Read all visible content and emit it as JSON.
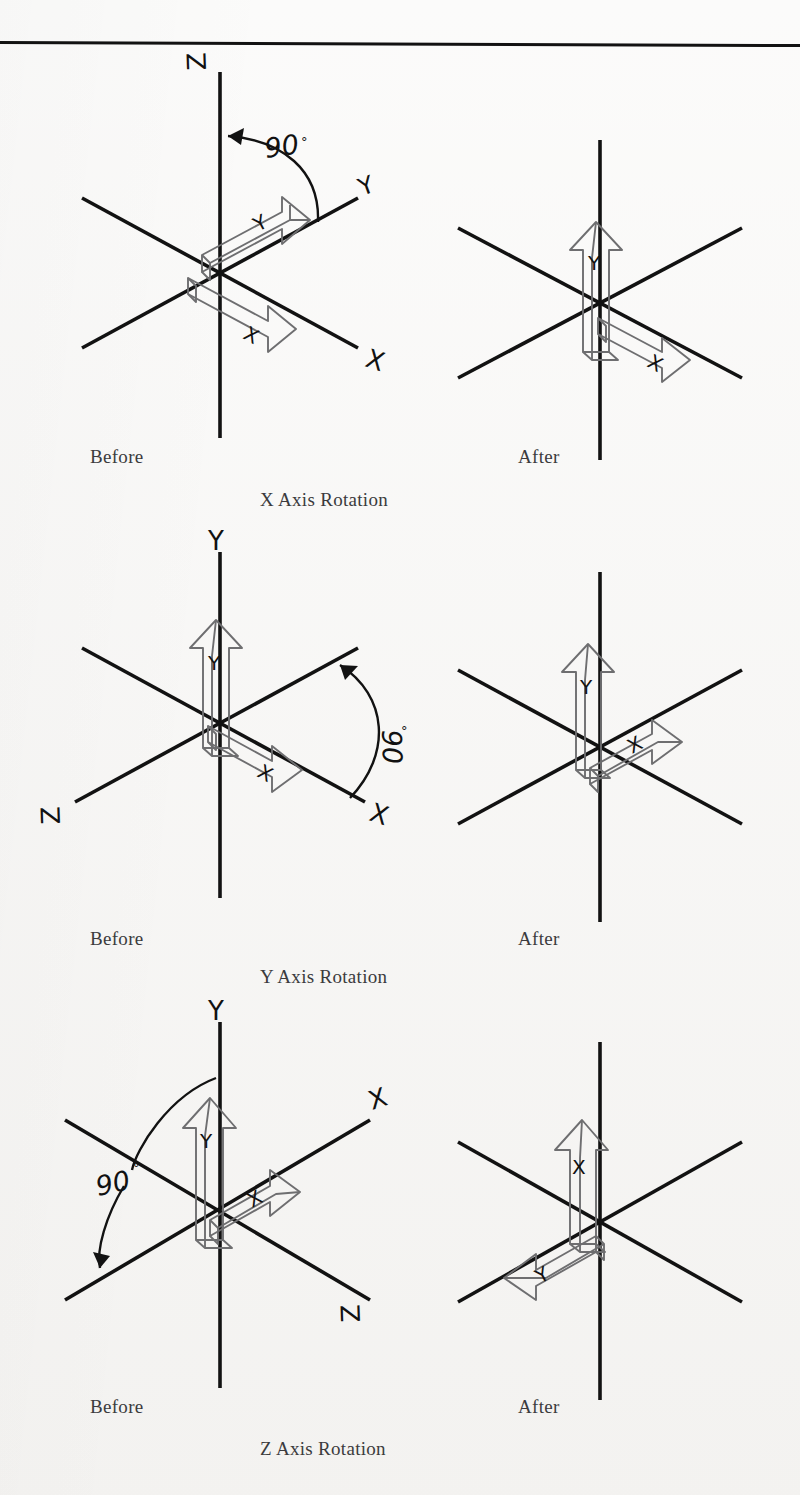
{
  "figure": {
    "background_color": "#f6f5f3",
    "ink_color": "#121212",
    "arrow_outline_color": "#6e6e70",
    "caption_color": "#3b3b3d",
    "top_rule": true
  },
  "rows": [
    {
      "id": "x-axis-rotation",
      "caption_center": "X Axis Rotation",
      "caption_left": "Before",
      "caption_right": "After",
      "angle_label": "90°",
      "before": {
        "axes": [
          {
            "name": "Z",
            "label": "Z",
            "direction": "up"
          },
          {
            "name": "Y",
            "label": "Y",
            "direction": "upper-right"
          },
          {
            "name": "X",
            "label": "X",
            "direction": "lower-right"
          }
        ],
        "arrows": [
          {
            "label": "Y",
            "points": "upper-right"
          },
          {
            "label": "X",
            "points": "lower-right"
          }
        ],
        "arc": {
          "from": "Y",
          "to": "Z",
          "value": "90°"
        }
      },
      "after": {
        "axes": [
          {
            "name": "Z",
            "label": "",
            "direction": "up"
          },
          {
            "name": "Y",
            "label": "",
            "direction": "upper-right"
          },
          {
            "name": "X",
            "label": "",
            "direction": "lower-right"
          }
        ],
        "arrows": [
          {
            "label": "Y",
            "points": "up"
          },
          {
            "label": "X",
            "points": "lower-right"
          }
        ]
      }
    },
    {
      "id": "y-axis-rotation",
      "caption_center": "Y Axis Rotation",
      "caption_left": "Before",
      "caption_right": "After",
      "angle_label": "90°",
      "before": {
        "axes": [
          {
            "name": "Y",
            "label": "Y",
            "direction": "up"
          },
          {
            "name": "X",
            "label": "X",
            "direction": "lower-right"
          },
          {
            "name": "Z",
            "label": "Z",
            "direction": "lower-left"
          }
        ],
        "arrows": [
          {
            "label": "Y",
            "points": "up"
          },
          {
            "label": "X",
            "points": "lower-right"
          }
        ],
        "arc": {
          "from": "X",
          "to": "down",
          "value": "90°"
        }
      },
      "after": {
        "axes": [
          {
            "name": "Y",
            "label": "",
            "direction": "up"
          },
          {
            "name": "X",
            "label": "",
            "direction": "upper-right"
          },
          {
            "name": "Z",
            "label": "",
            "direction": "lower-right"
          }
        ],
        "arrows": [
          {
            "label": "Y",
            "points": "up"
          },
          {
            "label": "X",
            "points": "upper-right"
          }
        ]
      }
    },
    {
      "id": "z-axis-rotation",
      "caption_center": "Z Axis Rotation",
      "caption_left": "Before",
      "caption_right": "After",
      "angle_label": "90°",
      "before": {
        "axes": [
          {
            "name": "Y",
            "label": "Y",
            "direction": "up"
          },
          {
            "name": "X",
            "label": "X",
            "direction": "upper-right"
          },
          {
            "name": "Z",
            "label": "Z",
            "direction": "lower-right"
          }
        ],
        "arrows": [
          {
            "label": "Y",
            "points": "up"
          },
          {
            "label": "X",
            "points": "upper-right"
          }
        ],
        "arc": {
          "from": "Y",
          "to": "lower-left",
          "value": "90°"
        }
      },
      "after": {
        "axes": [
          {
            "name": "Y",
            "label": "",
            "direction": "up"
          },
          {
            "name": "X",
            "label": "",
            "direction": "upper-right"
          },
          {
            "name": "Z",
            "label": "",
            "direction": "lower-right"
          }
        ],
        "arrows": [
          {
            "label": "X",
            "points": "up"
          },
          {
            "label": "Y",
            "points": "lower-left"
          }
        ]
      }
    }
  ]
}
